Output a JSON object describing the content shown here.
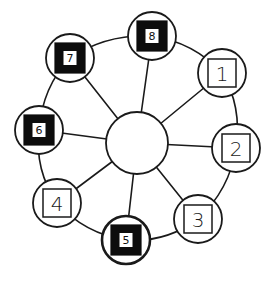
{
  "diagram": {
    "type": "hub-and-spoke ring",
    "hub": {
      "x": 137,
      "y": 143,
      "r": 31,
      "label": ""
    },
    "nodes": [
      {
        "id": "1",
        "label": "1",
        "style": "outline",
        "x": 222,
        "y": 73
      },
      {
        "id": "2",
        "label": "2",
        "style": "outline",
        "x": 236,
        "y": 148
      },
      {
        "id": "3",
        "label": "3",
        "style": "outline",
        "x": 198,
        "y": 219
      },
      {
        "id": "5",
        "label": "5",
        "style": "filled",
        "x": 126,
        "y": 240
      },
      {
        "id": "4",
        "label": "4",
        "style": "outline",
        "x": 57,
        "y": 203
      },
      {
        "id": "6",
        "label": "6",
        "style": "filled",
        "x": 39,
        "y": 130
      },
      {
        "id": "7",
        "label": "7",
        "style": "filled",
        "x": 70,
        "y": 58
      },
      {
        "id": "8",
        "label": "8",
        "style": "filled",
        "x": 152,
        "y": 36
      }
    ],
    "ring_order": [
      "8",
      "1",
      "2",
      "3",
      "5",
      "4",
      "6",
      "7"
    ],
    "spokes": "each node connects to hub",
    "colors": {
      "stroke": "#1a1a1a",
      "filled_box": "#0d0d0d",
      "background": "#ffffff"
    }
  }
}
